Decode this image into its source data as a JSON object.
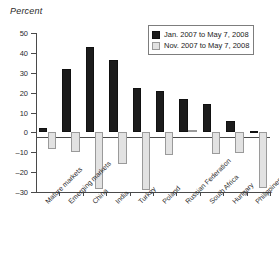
{
  "chart_data": {
    "type": "bar",
    "title": "",
    "subtitle": "",
    "xlabel": "",
    "ylabel": "Percent",
    "ylim": [
      -30,
      50
    ],
    "ytick_step": 10,
    "yticks": [
      50,
      40,
      30,
      20,
      10,
      0,
      -10,
      -20,
      -30
    ],
    "ytick_labels": [
      "50",
      "40",
      "30",
      "20",
      "10",
      "0",
      "–10",
      "–20",
      "–30"
    ],
    "grid": false,
    "legend_position": "top-right",
    "zero_line": true,
    "categories": [
      "Mature markets",
      "Emerging markets",
      "China",
      "India",
      "Turkey",
      "Poland",
      "Russian Federation",
      "South Africa",
      "Hungary",
      "Philippines"
    ],
    "series": [
      {
        "name": "Jan. 2007 to May 7, 2008",
        "color": "#1c1c1c",
        "values": [
          2.2,
          32.0,
          42.8,
          36.5,
          22.5,
          21.0,
          16.7,
          14.5,
          5.8,
          0.7
        ]
      },
      {
        "name": "Nov. 2007 to May 7, 2008",
        "color": "#e2e2e2",
        "values": [
          -8.4,
          -10.0,
          -28.4,
          -15.9,
          -29.0,
          -11.4,
          1.4,
          -10.8,
          -10.3,
          -28.0
        ]
      }
    ]
  },
  "legend": {
    "entries": [
      {
        "label": "Jan. 2007 to May 7, 2008",
        "swatch": "dark"
      },
      {
        "label": "Nov. 2007 to May 7, 2008",
        "swatch": "light"
      }
    ]
  }
}
